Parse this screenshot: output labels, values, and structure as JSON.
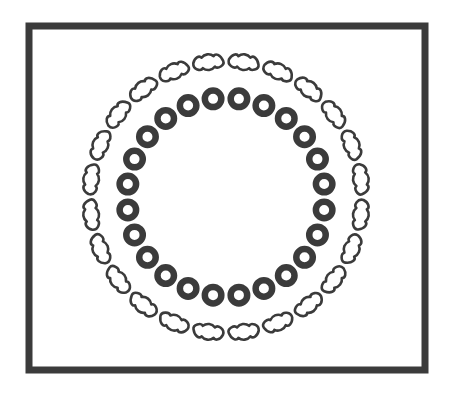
{
  "figure": {
    "canvas": {
      "width": 457,
      "height": 394,
      "background": "#ffffff"
    },
    "border_frame": {
      "name": "rectangular-border",
      "x": 29,
      "y": 26,
      "width": 396,
      "height": 344,
      "stroke_color": "#3b3b3b",
      "stroke_width": 7,
      "fill": "#ffffff"
    },
    "center": {
      "cx": 226,
      "cy": 197
    },
    "outer_ring": {
      "label": "outer-ring-peanut-shapes",
      "count": 24,
      "radius": 136,
      "start_angle_deg": -82.5,
      "angle_step_deg": 15,
      "shape": "peanut",
      "shape_length": 30,
      "shape_height": 17,
      "stroke_color": "#3b3b3b",
      "stroke_width": 2.6,
      "fill": "#ffffff"
    },
    "inner_ring": {
      "label": "inner-ring-annuli",
      "count": 24,
      "radius": 99,
      "start_angle_deg": -82.5,
      "angle_step_deg": 15,
      "shape": "annulus",
      "outer_diameter": 23,
      "hole_diameter": 10,
      "fill_color": "#3b3b3b",
      "hole_color": "#ffffff"
    },
    "colors": {
      "ink": "#3b3b3b",
      "paper": "#ffffff",
      "page": "#fdfdfd"
    }
  }
}
